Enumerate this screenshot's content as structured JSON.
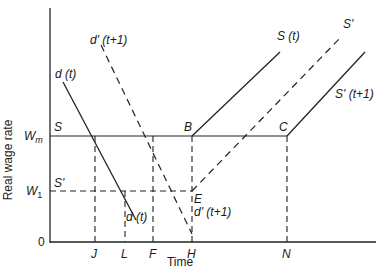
{
  "diagram": {
    "axes": {
      "y_label": "Real wage rate",
      "x_label": "Time",
      "origin_label": "0"
    },
    "y_levels": [
      {
        "key": "Wm",
        "label": "W",
        "sub": "m",
        "y": 136
      },
      {
        "key": "W1",
        "label": "W",
        "sub": "1",
        "y": 191
      }
    ],
    "x_ticks": [
      {
        "label": "J",
        "x": 95
      },
      {
        "label": "L",
        "x": 125
      },
      {
        "label": "F",
        "x": 153
      },
      {
        "label": "H",
        "x": 192
      },
      {
        "label": "N",
        "x": 287
      }
    ],
    "points": {
      "S": "S",
      "S_prime": "S'",
      "B": "B",
      "C": "C",
      "E": "E"
    },
    "curves": {
      "d_t": "d (t)",
      "d_t_low": "d (t)",
      "d_prime_t1": "d' (t+1)",
      "d_prime_t1_low": "d' (t+1)",
      "S_t": "S (t)",
      "S_prime": "S'",
      "S_prime_t1": "S' (t+1)"
    }
  }
}
